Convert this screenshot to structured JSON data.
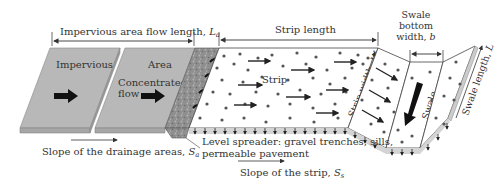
{
  "labels": {
    "impervious_flow_length": "Impervious area flow length, ",
    "impervious_flow_length_sym": "L",
    "impervious_flow_length_sub": "a",
    "strip_length": "Strip length",
    "swale_bottom_width_1": "Swale",
    "swale_bottom_width_2": "bottom",
    "swale_bottom_width_3": "width, ",
    "swale_bottom_width_sym": "b",
    "impervious": "Impervious",
    "area": "Area",
    "concentrated_1": "Concentrated",
    "concentrated_2": "flow",
    "strip": "Strip",
    "strip_width": "Strip width, ",
    "strip_width_sym": "W",
    "swale": "Swale",
    "swale_length": "Swale length, ",
    "swale_length_sym": "L",
    "slope_drainage": "Slope of the drainage areas, ",
    "slope_drainage_sym": "S",
    "slope_drainage_sub": "a",
    "level_spreader_1": "Level spreader: gravel trenches, sills,",
    "level_spreader_2": "permeable pavement",
    "slope_strip": "Slope of the strip, ",
    "slope_strip_sym": "S",
    "slope_strip_sub": "s"
  },
  "colors": {
    "impervious_fill": "#b8b8b8",
    "impervious_edge": "#9a9a9a",
    "gravel_fill": "#8c8c8c",
    "strip_fill": "#ffffff",
    "outline": "#444444",
    "arrow": "#111111",
    "infiltration_band": "#d4d4d4",
    "dot": "#555555"
  }
}
